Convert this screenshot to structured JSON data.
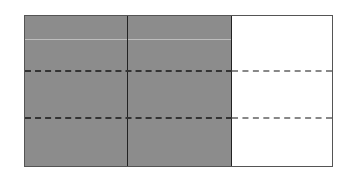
{
  "diagram": {
    "type": "fraction-area-model",
    "columns": 3,
    "shaded_columns": 2,
    "rows": 3,
    "colors": {
      "shaded": "#8c8c8c",
      "unshaded": "#ffffff",
      "border": "#555555"
    }
  }
}
